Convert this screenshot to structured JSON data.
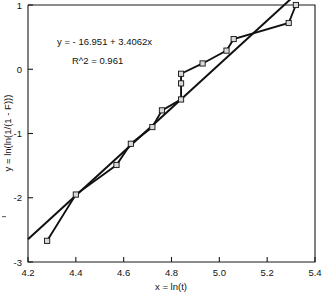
{
  "chart_data": {
    "type": "scatter",
    "title": "",
    "xlabel": "x = ln(t)",
    "ylabel": "y = ln(ln(1/(1 - F)))",
    "xlim": [
      4.2,
      5.4
    ],
    "ylim": [
      -3,
      1
    ],
    "xticks": [
      "4.2",
      "4.4",
      "4.6",
      "4.8",
      "5.0",
      "5.2",
      "5.4"
    ],
    "xtick_values": [
      4.2,
      4.4,
      4.6,
      4.8,
      5.0,
      5.2,
      5.4
    ],
    "yticks": [
      "1",
      "0",
      "-1",
      "-2",
      "-3"
    ],
    "ytick_values": [
      1,
      0,
      -1,
      -2,
      -3
    ],
    "grid": false,
    "legend": null,
    "marker_style": "open-square",
    "series": [
      {
        "name": "data",
        "type": "scatter-with-connecting-line",
        "x": [
          4.28,
          4.4,
          4.57,
          4.63,
          4.72,
          4.76,
          4.84,
          4.84,
          4.84,
          4.93,
          5.03,
          5.06,
          5.29,
          5.32
        ],
        "y": [
          -2.67,
          -1.95,
          -1.49,
          -1.16,
          -0.9,
          -0.64,
          -0.47,
          -0.22,
          -0.07,
          0.09,
          0.29,
          0.47,
          0.72,
          1.0
        ]
      },
      {
        "name": "least-squares fit",
        "type": "line",
        "x": [
          4.2,
          5.32
        ],
        "y": [
          -2.645,
          1.166
        ]
      }
    ],
    "annotations": [
      {
        "name": "regression-equation",
        "text": "y = - 16.951 + 3.4062x"
      },
      {
        "name": "r-squared",
        "text": "R^2 = 0.961"
      }
    ],
    "fit": {
      "intercept": -16.951,
      "slope": 3.4062,
      "r_squared": 0.961
    }
  },
  "colors": {
    "axis": "#1a1a1a",
    "line": "#111111",
    "marker_fill": "#d9d9d9",
    "background": "#ffffff"
  }
}
